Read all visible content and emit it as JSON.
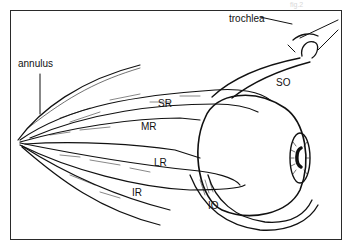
{
  "figure": {
    "labels": {
      "trochlea": "trochlea",
      "annulus": "annulus",
      "so": "SO",
      "sr": "SR",
      "mr": "MR",
      "lr": "LR",
      "ir": "IR",
      "io": "IO"
    },
    "watermark": "fig.2",
    "colors": {
      "ink": "#111111",
      "background": "#ffffff",
      "frame": "#2a2a2a"
    }
  }
}
